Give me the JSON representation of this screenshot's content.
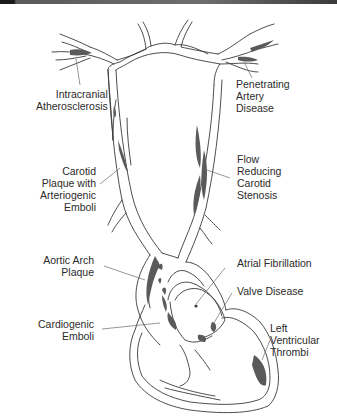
{
  "figure": {
    "colors": {
      "outline": "#3a3a3a",
      "lesion_fill": "#5a5a5a",
      "leader_line": "#6a6a6a",
      "text": "#2b2b2b",
      "top_bar": "#1a1a1a"
    }
  },
  "labels": {
    "intracranial": {
      "lines": [
        "Intracranial",
        "Atherosclerosis"
      ]
    },
    "penetrating": {
      "lines": [
        "Penetrating",
        "Artery",
        "Disease"
      ]
    },
    "carotid_plaque": {
      "lines": [
        "Carotid",
        "Plaque with",
        "Arteriogenic",
        "Emboli"
      ]
    },
    "flow_reducing": {
      "lines": [
        "Flow",
        "Reducing",
        "Carotid",
        "Stenosis"
      ]
    },
    "aortic_arch": {
      "lines": [
        "Aortic Arch",
        "Plaque"
      ]
    },
    "atrial_fib": {
      "lines": [
        "Atrial Fibrillation"
      ]
    },
    "valve": {
      "lines": [
        "Valve Disease"
      ]
    },
    "cardiogenic": {
      "lines": [
        "Cardiogenic",
        "Emboli"
      ]
    },
    "lv_thrombi": {
      "lines": [
        "Left",
        "Ventricular",
        "Thrombi"
      ]
    }
  }
}
